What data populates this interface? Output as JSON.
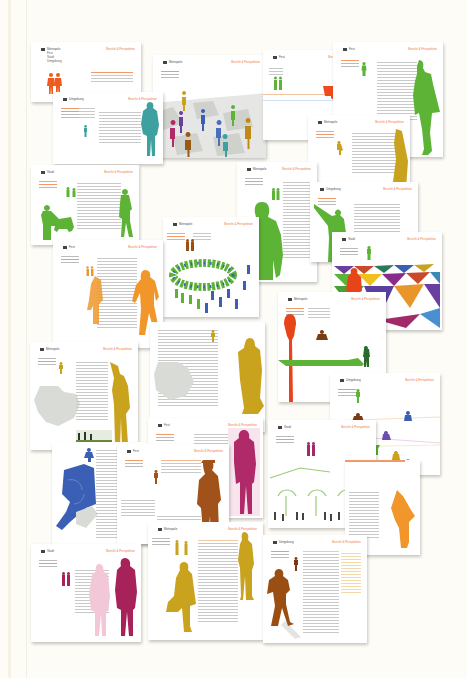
{
  "scene": {
    "description": "Photographed collage of printed report pages with colored human silhouettes",
    "background_color": "#fdfcf6",
    "header_accent_color": "#f07a3c"
  },
  "pages": [
    {
      "id": 1,
      "section": "Metropole",
      "menu": [
        "Metropole",
        "Fest",
        "Stadt",
        "Umgebung"
      ],
      "figure_color": "#f05a1e",
      "figure": "couple-walking"
    },
    {
      "id": 2,
      "section": "Metropole",
      "figure_color": "#7b4db0",
      "figure": "crowd-on-tiled-plaza"
    },
    {
      "id": 3,
      "section": "Fest",
      "figure_color": "#f04a1a",
      "figure": "horse-and-rider"
    },
    {
      "id": 4,
      "section": "Fest",
      "figure_color": "#5cb335",
      "figure": "standing-woman"
    },
    {
      "id": 5,
      "section": "Umgebung",
      "figure_color": "#3fa0a0",
      "figure": "standing-man"
    },
    {
      "id": 6,
      "section": "Metropole",
      "figure_color": "#c9a21e",
      "figure": "standing-figure"
    },
    {
      "id": 7,
      "section": "Stadt",
      "figure_color": "#5cb335",
      "figure": "woman-with-cart"
    },
    {
      "id": 8,
      "section": "Metropole",
      "figure_color": "#5cb335",
      "figure": "large-man"
    },
    {
      "id": 9,
      "section": "Umgebung",
      "figure_color": "#5cb335",
      "figure": "pointing-man"
    },
    {
      "id": 10,
      "section": "Fest",
      "figure_color": "#f0962a",
      "figure": "walking-man-with-bag"
    },
    {
      "id": 11,
      "section": "Metropole",
      "figure_color": "#5cb335",
      "figure": "crowd-circle"
    },
    {
      "id": 12,
      "section": "Stadt",
      "figure_color": "#e8441a",
      "figure": "standing-on-triangle-floor"
    },
    {
      "id": 13,
      "section": "Metropole",
      "figure_color": "#e8441a",
      "figure": "tall-shadow"
    },
    {
      "id": 14,
      "section": "Metropole",
      "figure_color": "#c9a21e",
      "figure": "waving-man"
    },
    {
      "id": 15,
      "section": "Metropole",
      "figure_color": "#c9a21e",
      "figure": "standing-man"
    },
    {
      "id": 16,
      "section": "Umgebung",
      "figure_color": "#7b4db0",
      "figure": "scattered-figures"
    },
    {
      "id": 17,
      "section": "Fest",
      "figure_color": "#3b5fb5",
      "figure": "sitting-figure"
    },
    {
      "id": 18,
      "section": "Fest",
      "figure_color": "#a0521a",
      "figure": "man-in-hat"
    },
    {
      "id": 19,
      "section": "Fest",
      "figure_color": "#b02a6a",
      "figure": "standing-man"
    },
    {
      "id": 20,
      "section": "Stadt",
      "figure_color": "#5cb335",
      "figure": "trees-and-crowd"
    },
    {
      "id": 21,
      "section": "Stadt",
      "figure_color": "#f0962a",
      "figure": "standing-figure"
    },
    {
      "id": 22,
      "section": "Stadt",
      "figure_color": "#a8225a",
      "figure": "couple"
    },
    {
      "id": 23,
      "section": "Metropole",
      "figure_color": "#c9a21e",
      "figure": "woman-with-bag"
    },
    {
      "id": 24,
      "section": "Umgebung",
      "figure_color": "#9a4e12",
      "figure": "man-arms-crossed"
    }
  ],
  "labels": {
    "header_title": "Bericht & Perspektive",
    "p1": "Metropole",
    "p2": "Metropole",
    "p3": "Fest",
    "p4": "Fest",
    "p5": "Umgebung",
    "p6": "Metropole",
    "p7": "Stadt",
    "p8": "Metropole",
    "p9": "Umgebung",
    "p10": "Fest",
    "p11": "Metropole",
    "p12": "Stadt",
    "p13": "Metropole",
    "p14": "Metropole",
    "p16": "Umgebung",
    "p18": "Fest",
    "p19": "Fest",
    "p20": "Stadt",
    "p22": "Stadt",
    "p23": "Metropole",
    "p24": "Umgebung",
    "p1_menu": [
      "Metropole",
      "Fest",
      "Stadt",
      "Umgebung"
    ]
  }
}
